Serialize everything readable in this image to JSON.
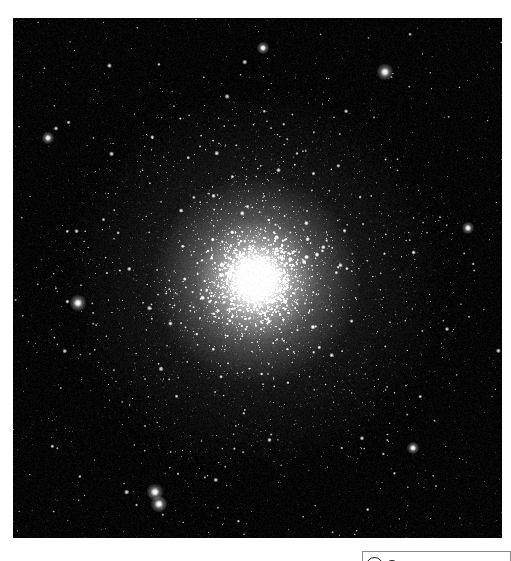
{
  "page": {
    "background_color": "#ffffff",
    "width": 511,
    "height": 561
  },
  "plate": {
    "name": "globular-cluster-plate",
    "alt_text": "Grayscale astronomical photograph of a dense globular star cluster",
    "background_color": "#050505",
    "star_color": "#ffffff",
    "left": 13,
    "top": 18,
    "width": 489,
    "height": 520,
    "cluster": {
      "center_x": 243,
      "center_y": 262,
      "core_radius": 34,
      "halo_radius": 205,
      "peak_brightness": 1.0
    }
  },
  "magnitude_key": {
    "name": "magnitude-scale-legend",
    "title": "",
    "clipped": true,
    "border_color": "#8a8a8a",
    "symbol_color": "#1a1a1a",
    "symbol_sizes": [
      17,
      14,
      12,
      10,
      9,
      8,
      7,
      6,
      5,
      4,
      4,
      3,
      3,
      2
    ]
  },
  "chart_data": {
    "type": "scatter",
    "title": "",
    "subtitle": "",
    "xlabel": "",
    "ylabel": "",
    "legend_position": "bottom-right",
    "grid": false,
    "annotations": [],
    "tick_labels": {
      "x": [],
      "y": []
    },
    "series": [
      {
        "name": "cluster-core-stars",
        "description": "Unresolved bright core of the globular cluster",
        "count": 1400,
        "color": "#ffffff"
      },
      {
        "name": "cluster-halo-stars",
        "description": "Resolved member stars in the cluster halo",
        "count": 3600,
        "color": "#f4f4f4"
      },
      {
        "name": "field-stars",
        "description": "Foreground and background field stars",
        "count": 2200,
        "color": "#e8e8e8"
      }
    ],
    "bright_field_stars": [
      {
        "x": 372,
        "y": 54,
        "magnitude": 1
      },
      {
        "x": 65,
        "y": 285,
        "magnitude": 1
      },
      {
        "x": 142,
        "y": 474,
        "magnitude": 1
      },
      {
        "x": 146,
        "y": 486,
        "magnitude": 1
      },
      {
        "x": 400,
        "y": 430,
        "magnitude": 2
      },
      {
        "x": 35,
        "y": 120,
        "magnitude": 2
      },
      {
        "x": 455,
        "y": 210,
        "magnitude": 2
      },
      {
        "x": 250,
        "y": 30,
        "magnitude": 2
      }
    ]
  }
}
